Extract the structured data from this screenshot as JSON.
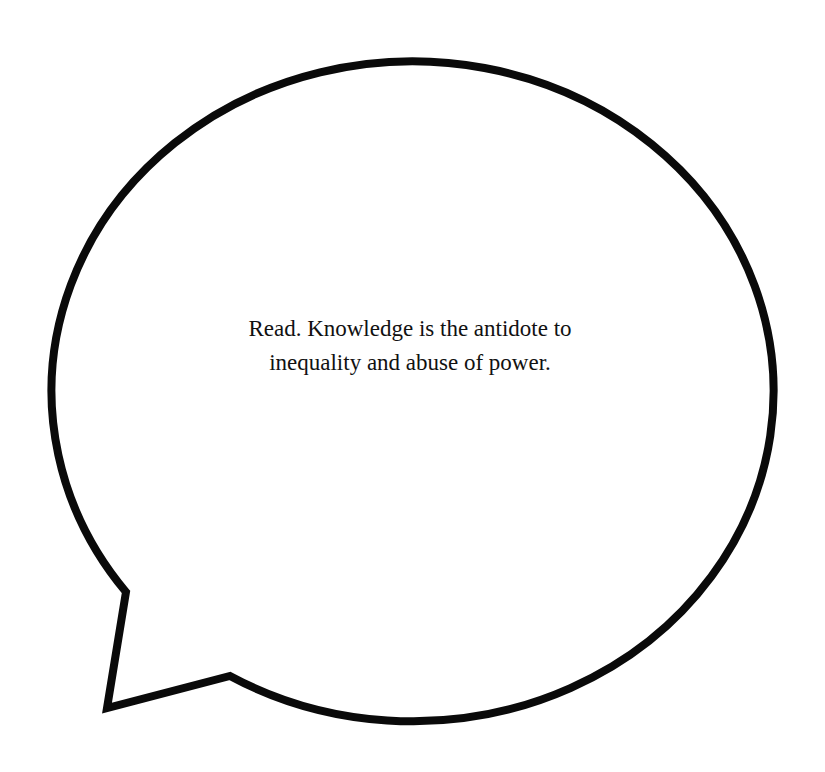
{
  "speech_bubble": {
    "text_lines": [
      "Read. Knowledge is the antidote to",
      "inequality and abuse of power."
    ],
    "stroke_color": "#0a0a0a",
    "fill_color": "#ffffff",
    "background_color": "#ffffff"
  }
}
